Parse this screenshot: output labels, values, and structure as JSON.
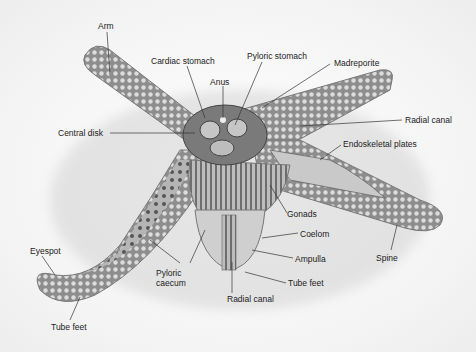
{
  "diagram": {
    "labels": {
      "arm": "Arm",
      "cardiac_stomach": "Cardiac stomach",
      "pyloric_stomach": "Pyloric stomach",
      "anus": "Anus",
      "madreporite": "Madreporite",
      "central_disk": "Central disk",
      "radial_canal_right": "Radial canal",
      "endoskeletal_plates": "Endoskeletal plates",
      "gonads": "Gonads",
      "coelom": "Coelom",
      "ampulla": "Ampulla",
      "spine": "Spine",
      "eyespot": "Eyespot",
      "pyloric_caecum": "Pyloric\ncaecum",
      "tube_feet_bottom": "Tube feet",
      "radial_canal_bottom": "Radial canal",
      "tube_feet_left": "Tube feet"
    },
    "colors": {
      "body": "#9a9a9a",
      "body_dark": "#5a5a5a",
      "tubercle": "#d8d8d8",
      "leader_line": "#333333",
      "label_text": "#222222"
    }
  }
}
